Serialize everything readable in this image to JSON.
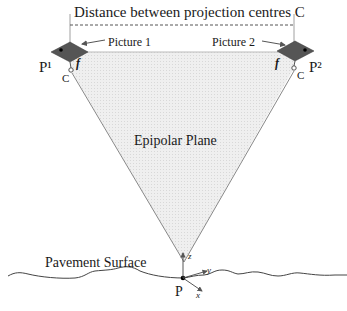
{
  "diagram": {
    "title": "Distance between projection centres C",
    "picture_1_label": "Picture 1",
    "picture_2_label": "Picture 2",
    "plane_label": "Epipolar Plane",
    "surface_label": "Pavement Surface",
    "point_label": "P",
    "camera_1_label": "P¹",
    "camera_2_label": "P²",
    "centre_1_label": "C",
    "centre_2_label": "C",
    "focal_1_label": "f",
    "focal_2_label": "f",
    "axes": {
      "z": "z",
      "y": "y",
      "x": "x"
    },
    "colors": {
      "plane_fill": "#ececec",
      "camera_fill": "#555555",
      "line": "#666666",
      "text": "#1a1a1a"
    }
  }
}
